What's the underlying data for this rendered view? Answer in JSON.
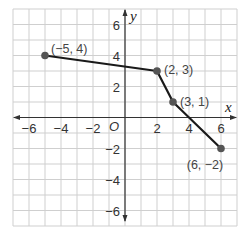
{
  "chart_data": {
    "type": "line",
    "title": "",
    "xlabel": "x",
    "ylabel": "y",
    "origin_label": "O",
    "xlim": [
      -7,
      7
    ],
    "ylim": [
      -7,
      7
    ],
    "grid": true,
    "x_ticks": [
      -6,
      -4,
      -2,
      2,
      4,
      6
    ],
    "y_ticks": [
      6,
      4,
      2,
      -2,
      -4,
      -6
    ],
    "x_tick_labels": [
      "−6",
      "−4",
      "−2",
      "2",
      "4",
      "6"
    ],
    "y_tick_labels": [
      "6",
      "4",
      "2",
      "−2",
      "−4",
      "−6"
    ],
    "series": [
      {
        "name": "piecewise-linear",
        "points": [
          {
            "x": -5,
            "y": 4,
            "label": "(−5, 4)"
          },
          {
            "x": 2,
            "y": 3,
            "label": "(2, 3)"
          },
          {
            "x": 3,
            "y": 1,
            "label": "(3, 1)"
          },
          {
            "x": 6,
            "y": -2,
            "label": "(6, −2)"
          }
        ]
      }
    ],
    "colors": {
      "line": "#1a1a1a",
      "point": "#555555",
      "grid": "#cfcfcf",
      "axis": "#333333"
    }
  }
}
